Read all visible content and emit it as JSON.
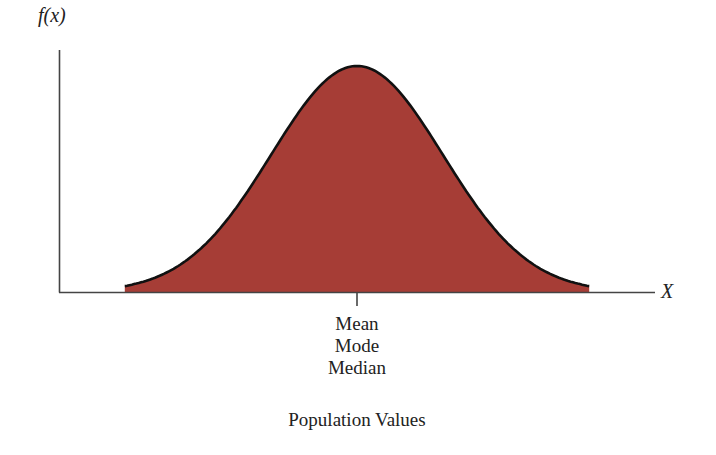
{
  "chart_data": {
    "type": "area",
    "title": "",
    "xlabel": "Population Values",
    "ylabel": "f(x)",
    "x_axis_symbol": "X",
    "distribution": "normal",
    "center_tick_labels": [
      "Mean",
      "Mode",
      "Median"
    ],
    "x": [
      -2.7,
      -2.0,
      -1.5,
      -1.0,
      -0.5,
      0,
      0.5,
      1.0,
      1.5,
      2.0,
      2.7
    ],
    "values": [
      0.01,
      0.054,
      0.13,
      0.242,
      0.352,
      0.399,
      0.352,
      0.242,
      0.13,
      0.054,
      0.01
    ],
    "xlim": [
      -3.6,
      3.6
    ],
    "ylim": [
      0,
      0.43
    ],
    "grid": false,
    "legend": null,
    "fill_color": "#a63d36",
    "line_color": "#111111"
  },
  "labels": {
    "y_axis": "f(x)",
    "x_axis": "X",
    "center": [
      "Mean",
      "Mode",
      "Median"
    ],
    "x_title": "Population Values"
  }
}
